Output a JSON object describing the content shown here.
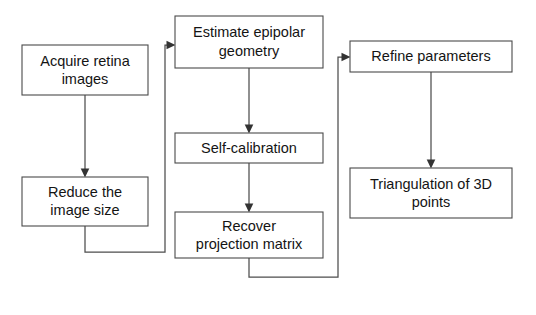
{
  "diagram": {
    "type": "flowchart",
    "canvas": {
      "width": 536,
      "height": 315,
      "background": "#ffffff"
    },
    "style": {
      "box_fill": "#ffffff",
      "box_stroke": "#4a4a4a",
      "text_color": "#141414",
      "edge_color": "#4d4d4d"
    },
    "nodes": [
      {
        "id": "acquire",
        "label_line1": "Acquire retina",
        "label_line2": "images",
        "x": 22,
        "y": 45,
        "w": 126,
        "h": 50,
        "column": "left"
      },
      {
        "id": "reduce",
        "label_line1": "Reduce the",
        "label_line2": "image size",
        "x": 22,
        "y": 177,
        "w": 126,
        "h": 49,
        "column": "left"
      },
      {
        "id": "epipolar",
        "label_line1": "Estimate epipolar",
        "label_line2": "geometry",
        "x": 175,
        "y": 16,
        "w": 148,
        "h": 52,
        "column": "middle"
      },
      {
        "id": "selfcal",
        "label_line1": "Self-calibration",
        "label_line2": "",
        "x": 175,
        "y": 133,
        "w": 148,
        "h": 30,
        "column": "middle"
      },
      {
        "id": "recover",
        "label_line1": "Recover",
        "label_line2": "projection matrix",
        "x": 175,
        "y": 212,
        "w": 148,
        "h": 46,
        "column": "middle"
      },
      {
        "id": "refine",
        "label_line1": "Refine parameters",
        "label_line2": "",
        "x": 350,
        "y": 41,
        "w": 162,
        "h": 31,
        "column": "right"
      },
      {
        "id": "triangulation",
        "label_line1": "Triangulation of 3D",
        "label_line2": "points",
        "x": 350,
        "y": 168,
        "w": 162,
        "h": 50,
        "column": "right"
      }
    ],
    "edges": [
      {
        "id": "acquire-to-reduce",
        "from": "acquire",
        "to": "reduce",
        "kind": "straight-down",
        "arrow": "down"
      },
      {
        "id": "reduce-to-epipolar",
        "from": "reduce",
        "to": "epipolar",
        "kind": "elbow-right-up",
        "arrow": "right"
      },
      {
        "id": "epipolar-to-selfcal",
        "from": "epipolar",
        "to": "selfcal",
        "kind": "straight-down",
        "arrow": "down"
      },
      {
        "id": "selfcal-to-recover",
        "from": "selfcal",
        "to": "recover",
        "kind": "straight-down",
        "arrow": "down"
      },
      {
        "id": "recover-to-refine",
        "from": "recover",
        "to": "refine",
        "kind": "elbow-right-up",
        "arrow": "right"
      },
      {
        "id": "refine-to-triangulation",
        "from": "refine",
        "to": "triangulation",
        "kind": "straight-down",
        "arrow": "down"
      }
    ]
  }
}
